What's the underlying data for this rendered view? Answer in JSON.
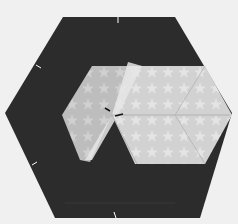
{
  "image": {
    "description": "Photograph of a dark fabric hexagon with a lighter star-print fabric hexagon folded on top, with pins marking the edges",
    "colors": {
      "background": "#f2f2f2",
      "dark_fabric": "#2a2a2a",
      "light_fabric": "#d6d6d6",
      "light_fabric_shade": "#c4c4c4",
      "fold_highlight": "#e8e8e8",
      "pin": "#ffffff"
    }
  }
}
